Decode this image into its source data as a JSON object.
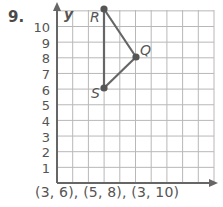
{
  "problem": {
    "number": "9."
  },
  "axis": {
    "y_label": "y",
    "y_ticks": [
      "10",
      "9",
      "8",
      "7",
      "6",
      "5",
      "4",
      "3",
      "2",
      "1"
    ]
  },
  "points": [
    {
      "label": "R",
      "x": 3,
      "y": 10
    },
    {
      "label": "Q",
      "x": 5,
      "y": 8
    },
    {
      "label": "S",
      "x": 3,
      "y": 6
    }
  ],
  "answer": "(3, 6), (5, 8), (3, 10)",
  "colors": {
    "line": "#666666",
    "grid": "#b8b8b8",
    "axis": "#666666",
    "text": "#555555"
  },
  "chart_data": {
    "type": "scatter",
    "title": "",
    "xlabel": "",
    "ylabel": "y",
    "xlim": [
      0,
      10
    ],
    "ylim": [
      0,
      11
    ],
    "grid": true,
    "series": [
      {
        "name": "triangle RQS",
        "points": [
          {
            "label": "R",
            "x": 3,
            "y": 10
          },
          {
            "label": "Q",
            "x": 5,
            "y": 8
          },
          {
            "label": "S",
            "x": 3,
            "y": 6
          }
        ]
      }
    ],
    "y_tick_labels": [
      "1",
      "2",
      "3",
      "4",
      "5",
      "6",
      "7",
      "8",
      "9",
      "10"
    ]
  }
}
